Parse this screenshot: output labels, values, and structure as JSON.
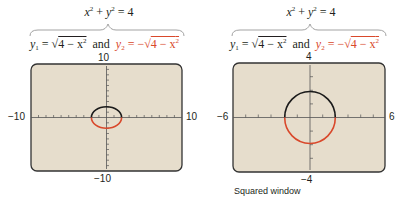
{
  "panels": [
    {
      "id": "standard",
      "top_equation": {
        "lhs": "x",
        "sup1": "2",
        "plus": " + ",
        "y": "y",
        "sup2": "2",
        "rhs": " = 4"
      },
      "eq1": {
        "y": "y",
        "sub": "1",
        "eq": " = √",
        "body": "4 − x",
        "sup": "2"
      },
      "and": "and",
      "eq2": {
        "y": "y",
        "sub": "2",
        "eq": " = −√",
        "body": "4 − x",
        "sup": "2"
      },
      "window": {
        "xmin": "−10",
        "xmax": "10",
        "ymin": "−10",
        "ymax": "10"
      },
      "caption": ""
    },
    {
      "id": "squared",
      "top_equation": {
        "lhs": "x",
        "sup1": "2",
        "plus": " + ",
        "y": "y",
        "sup2": "2",
        "rhs": " = 4"
      },
      "eq1": {
        "y": "y",
        "sub": "1",
        "eq": " = √",
        "body": "4 − x",
        "sup": "2"
      },
      "and": "and",
      "eq2": {
        "y": "y",
        "sub": "2",
        "eq": " = −√",
        "body": "4 − x",
        "sup": "2"
      },
      "window": {
        "xmin": "−6",
        "xmax": "6",
        "ymin": "−4",
        "ymax": "4"
      },
      "caption": "Squared window"
    }
  ],
  "colors": {
    "upper_curve": "#1a1a1a",
    "lower_curve": "#d9482b",
    "screen_bg": "#e6ddcc",
    "screen_border": "#333333"
  }
}
